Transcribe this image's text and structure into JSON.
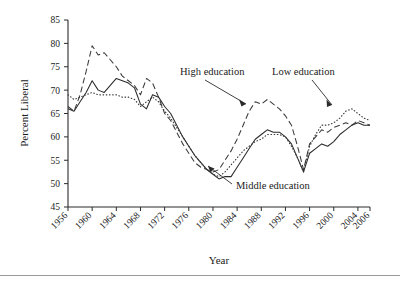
{
  "chart_data": {
    "type": "line",
    "title": "",
    "subtitle": "",
    "xlabel": "Year",
    "ylabel": "Percent Liberal",
    "xlim": [
      1956,
      2006
    ],
    "ylim": [
      45,
      85
    ],
    "xticks": [
      1956,
      1960,
      1964,
      1968,
      1972,
      1976,
      1980,
      1984,
      1988,
      1992,
      1996,
      2000,
      2004,
      2006
    ],
    "yticks": [
      45,
      50,
      55,
      60,
      65,
      70,
      75,
      80,
      85
    ],
    "grid": false,
    "legend_position": "inline-annotations",
    "annotations": [
      {
        "text": "High education",
        "points_to_series": "High education"
      },
      {
        "text": "Low education",
        "points_to_series": "Low education"
      },
      {
        "text": "Middle education",
        "points_to_series": "Middle education"
      }
    ],
    "x": [
      1956,
      1957,
      1958,
      1959,
      1960,
      1961,
      1962,
      1963,
      1964,
      1965,
      1966,
      1967,
      1968,
      1969,
      1970,
      1971,
      1972,
      1973,
      1974,
      1975,
      1976,
      1977,
      1978,
      1979,
      1980,
      1981,
      1982,
      1983,
      1984,
      1985,
      1986,
      1987,
      1988,
      1989,
      1990,
      1991,
      1992,
      1993,
      1994,
      1995,
      1996,
      1997,
      1998,
      1999,
      2000,
      2001,
      2002,
      2003,
      2004,
      2005,
      2006
    ],
    "series": [
      {
        "name": "High education",
        "style": "dashed",
        "values": [
          66.5,
          65.5,
          69.0,
          74.0,
          79.5,
          77.5,
          78.0,
          76.5,
          75.0,
          73.0,
          72.0,
          71.0,
          69.0,
          72.5,
          71.5,
          68.5,
          65.0,
          63.5,
          61.0,
          58.5,
          56.5,
          54.5,
          53.5,
          53.0,
          52.5,
          53.0,
          55.0,
          57.0,
          59.5,
          62.5,
          65.5,
          67.5,
          67.0,
          68.0,
          67.0,
          66.0,
          64.5,
          62.5,
          58.0,
          53.0,
          58.5,
          60.0,
          61.5,
          61.0,
          62.0,
          62.5,
          63.0,
          62.5,
          63.5,
          63.0,
          62.5
        ]
      },
      {
        "name": "Middle education",
        "style": "solid",
        "values": [
          66.0,
          65.5,
          67.5,
          69.5,
          72.0,
          70.0,
          69.5,
          71.0,
          72.5,
          72.0,
          71.5,
          70.5,
          67.0,
          66.0,
          69.0,
          68.5,
          66.5,
          65.0,
          62.5,
          60.0,
          58.0,
          56.0,
          54.5,
          53.0,
          52.0,
          51.0,
          51.5,
          51.5,
          53.5,
          55.5,
          57.5,
          59.5,
          60.5,
          61.5,
          61.0,
          61.0,
          60.0,
          58.5,
          55.5,
          52.5,
          56.5,
          57.5,
          58.5,
          58.0,
          59.0,
          60.5,
          61.5,
          62.5,
          63.0,
          62.5,
          62.5
        ]
      },
      {
        "name": "Low education",
        "style": "dotted",
        "values": [
          69.0,
          68.0,
          68.5,
          69.0,
          69.5,
          69.0,
          69.0,
          69.0,
          69.0,
          68.5,
          68.5,
          68.0,
          66.5,
          67.5,
          68.5,
          67.5,
          65.5,
          64.0,
          62.0,
          60.0,
          58.0,
          56.0,
          54.5,
          53.0,
          52.0,
          51.5,
          52.5,
          54.0,
          55.5,
          57.0,
          58.0,
          59.0,
          59.5,
          60.5,
          60.5,
          60.5,
          60.0,
          58.0,
          55.5,
          52.5,
          58.0,
          60.5,
          62.5,
          62.5,
          63.0,
          64.0,
          65.5,
          66.0,
          65.0,
          64.0,
          63.5
        ]
      }
    ]
  },
  "annotations": {
    "high_education": "High education",
    "low_education": "Low education",
    "middle_education": "Middle education"
  },
  "axes": {
    "y_title": "Percent Liberal",
    "x_title": "Year",
    "y_tick_labels": [
      "85",
      "80",
      "75",
      "70",
      "65",
      "60",
      "55",
      "50",
      "45"
    ],
    "x_tick_labels": [
      "1956",
      "1960",
      "1964",
      "1968",
      "1972",
      "1976",
      "1980",
      "1984",
      "1988",
      "1992",
      "1996",
      "2000",
      "2004",
      "2006"
    ]
  },
  "colors": {
    "axis": "#2b2b2b",
    "text": "#1a1a1a",
    "background": "#ffffff",
    "rule": "#9a9a9a"
  }
}
